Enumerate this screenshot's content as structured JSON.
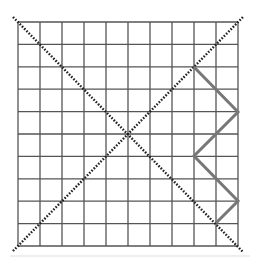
{
  "diagram": {
    "type": "grid-with-diagonals-and-path",
    "grid": {
      "columns": 10,
      "rows": 10,
      "x0": 18,
      "y0": 22,
      "x1": 238,
      "y1": 246,
      "line_color": "#555555"
    },
    "diagonals": {
      "color": "#222222",
      "style": "dotted",
      "main": {
        "from": [
          13,
          17
        ],
        "to": [
          243,
          252
        ]
      },
      "anti": {
        "from": [
          13,
          251
        ],
        "to": [
          243,
          17
        ]
      }
    },
    "path": {
      "color": "#777777",
      "width": 3,
      "points": [
        [
          194,
          67
        ],
        [
          238,
          112
        ],
        [
          194,
          156
        ],
        [
          238,
          201
        ],
        [
          216,
          223
        ]
      ]
    },
    "baseline": {
      "y": 256,
      "color": "#dddddd"
    }
  }
}
